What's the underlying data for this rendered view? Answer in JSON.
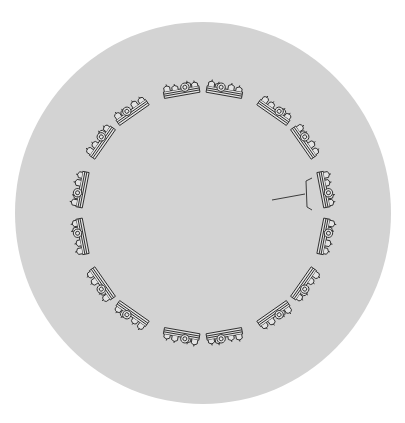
{
  "diagram": {
    "canvas": {
      "width": 405,
      "height": 423,
      "background": "#ffffff"
    },
    "disc": {
      "cx": 203,
      "cy": 213,
      "rx": 188,
      "ry": 191,
      "fill": "#d3d3d3"
    },
    "ring": {
      "cx": 203,
      "cy": 213,
      "radius": 126,
      "glyph_count": 16,
      "glyph_width": 36,
      "glyph_height": 13,
      "stroke": "#2a2a2a",
      "glyph_fill": "#e4e4e4",
      "angles_deg": [
        -100,
        -80,
        -55,
        -35,
        -11,
        11,
        35,
        55,
        80,
        100,
        125,
        145,
        169,
        191,
        215,
        235
      ]
    },
    "pointer": {
      "line": {
        "x1": 272,
        "y1": 200,
        "x2": 305,
        "y2": 194
      },
      "bracket": {
        "x": 306,
        "top": 178,
        "bottom": 210,
        "tick": 6
      },
      "stroke": "#2a2a2a"
    }
  }
}
